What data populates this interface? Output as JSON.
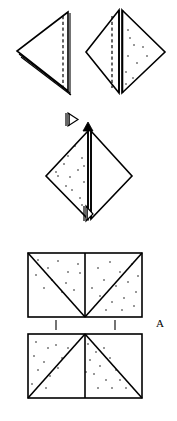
{
  "figure": {
    "background_color": "#ffffff",
    "ink_color": "#000000",
    "width": 177,
    "height": 421,
    "labels": [
      {
        "id": "label-a",
        "text": "A",
        "x": 160,
        "y": 324
      }
    ],
    "panels": [
      {
        "id": "panel-top-left",
        "name": "folded-triangle-left",
        "description": "Left-pointing triangle with vertical dashed crease near right edge and doubled fold line along lower edge",
        "shape": "triangle",
        "shaded": false,
        "crease": "vertical-dashed",
        "vertices": [
          [
            68,
            12
          ],
          [
            17,
            51
          ],
          [
            68,
            91
          ]
        ]
      },
      {
        "id": "panel-top-right",
        "name": "folded-diamond-right",
        "description": "Diamond (square rotated 45 degrees) with vertical dashed crease left of centre, doubled vertical fold line at centre, stippled right half",
        "shape": "diamond",
        "shaded_half": "right",
        "crease": "vertical-dashed",
        "vertices": [
          [
            119,
            10
          ],
          [
            165,
            52
          ],
          [
            119,
            93
          ],
          [
            86,
            52
          ]
        ]
      },
      {
        "id": "panel-middle",
        "name": "stippled-diamond",
        "description": "Diamond with solid vertical centre line, stippled left half, open triangular arrow marker above and small arrow marker below",
        "shape": "diamond",
        "shaded_half": "left",
        "crease": "vertical-solid",
        "vertices": [
          [
            88,
            131
          ],
          [
            132,
            176
          ],
          [
            88,
            219
          ],
          [
            46,
            176
          ]
        ]
      },
      {
        "id": "panel-bottom-upper",
        "name": "rectangle-with-v-fold",
        "description": "Rectangle split into two squares; diagonals form a V meeting at bottom centre; stippling above the diagonals",
        "shape": "rectangle",
        "shaded": true,
        "diagonal_pattern": "V",
        "bounds": [
          28,
          253,
          142,
          317
        ]
      },
      {
        "id": "panel-bottom-lower",
        "name": "rectangle-with-lambda-fold",
        "description": "Rectangle split into two squares; diagonals form an inverted V meeting at top centre; stippling in left and centre regions",
        "shape": "rectangle",
        "shaded": true,
        "diagonal_pattern": "inverted-V",
        "bounds": [
          28,
          334,
          142,
          398
        ]
      }
    ],
    "markers": [
      {
        "id": "marker-arrow-open-top",
        "name": "fold-direction-arrow",
        "symbol": "open-triangle-arrow",
        "x": 73,
        "y": 120
      },
      {
        "id": "marker-arrow-up",
        "name": "fold-up-arrow",
        "symbol": "up-arrow",
        "x": 87,
        "y": 126
      },
      {
        "id": "marker-arrow-down",
        "name": "fold-down-arrow",
        "symbol": "down-arrow",
        "x": 87,
        "y": 214
      },
      {
        "id": "tick-left",
        "name": "alignment-tick-left",
        "symbol": "vertical-tick",
        "x": 56,
        "y": 320
      },
      {
        "id": "tick-right",
        "name": "alignment-tick-right",
        "symbol": "vertical-tick",
        "x": 115,
        "y": 320
      }
    ],
    "stipple": {
      "panel_top_right": [
        [
          130,
          38
        ],
        [
          143,
          47
        ],
        [
          128,
          56
        ],
        [
          137,
          63
        ],
        [
          125,
          72
        ],
        [
          134,
          45
        ],
        [
          122,
          47
        ],
        [
          140,
          56
        ],
        [
          128,
          30
        ],
        [
          133,
          78
        ]
      ],
      "panel_middle": [
        [
          75,
          146
        ],
        [
          82,
          158
        ],
        [
          64,
          164
        ],
        [
          78,
          170
        ],
        [
          70,
          177
        ],
        [
          85,
          182
        ],
        [
          60,
          176
        ],
        [
          72,
          190
        ],
        [
          80,
          198
        ],
        [
          66,
          186
        ],
        [
          88,
          165
        ],
        [
          84,
          205
        ],
        [
          76,
          162
        ],
        [
          58,
          170
        ]
      ],
      "panel_bottom_upper": [
        [
          38,
          260
        ],
        [
          48,
          268
        ],
        [
          58,
          261
        ],
        [
          68,
          272
        ],
        [
          78,
          264
        ],
        [
          88,
          273
        ],
        [
          36,
          275
        ],
        [
          52,
          280
        ],
        [
          66,
          283
        ],
        [
          44,
          288
        ],
        [
          60,
          292
        ],
        [
          74,
          288
        ],
        [
          98,
          268
        ],
        [
          110,
          262
        ],
        [
          120,
          272
        ],
        [
          132,
          264
        ],
        [
          104,
          280
        ],
        [
          116,
          286
        ],
        [
          128,
          282
        ],
        [
          136,
          292
        ],
        [
          100,
          292
        ],
        [
          112,
          300
        ],
        [
          124,
          296
        ],
        [
          134,
          304
        ],
        [
          90,
          284
        ],
        [
          138,
          276
        ]
      ],
      "panel_bottom_lower": [
        [
          36,
          342
        ],
        [
          48,
          348
        ],
        [
          34,
          356
        ],
        [
          44,
          362
        ],
        [
          56,
          345
        ],
        [
          38,
          370
        ],
        [
          50,
          376
        ],
        [
          32,
          384
        ],
        [
          46,
          386
        ],
        [
          60,
          358
        ],
        [
          66,
          350
        ],
        [
          58,
          368
        ],
        [
          88,
          344
        ],
        [
          96,
          352
        ],
        [
          104,
          348
        ],
        [
          90,
          360
        ],
        [
          100,
          366
        ],
        [
          110,
          358
        ],
        [
          94,
          374
        ],
        [
          106,
          380
        ],
        [
          116,
          368
        ],
        [
          120,
          378
        ],
        [
          112,
          388
        ],
        [
          98,
          386
        ],
        [
          86,
          372
        ],
        [
          124,
          386
        ]
      ]
    }
  }
}
